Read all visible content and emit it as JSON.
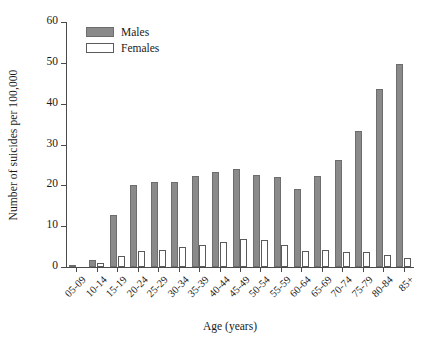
{
  "chart_data": {
    "type": "bar",
    "title": "",
    "xlabel": "Age (years)",
    "ylabel": "Number of suicides per 100,000",
    "categories": [
      "05-09",
      "10-14",
      "15-19",
      "20-24",
      "25-29",
      "30-34",
      "35-39",
      "40-44",
      "45-49",
      "50-54",
      "55-59",
      "60-64",
      "65-69",
      "70-74",
      "75-79",
      "80-84",
      "85+"
    ],
    "series": [
      {
        "name": "Males",
        "color": "#8a8a8a",
        "values": [
          0.1,
          1.8,
          12.7,
          20.1,
          20.7,
          20.9,
          22.2,
          23.2,
          23.9,
          22.6,
          22.0,
          19.2,
          22.2,
          26.3,
          33.3,
          43.6,
          49.7
        ]
      },
      {
        "name": "Females",
        "color": "#ffffff",
        "values": [
          0.0,
          0.9,
          2.6,
          3.9,
          4.2,
          5.0,
          5.4,
          6.2,
          6.9,
          6.6,
          5.4,
          4.0,
          4.2,
          3.6,
          3.7,
          3.0,
          2.3
        ]
      }
    ],
    "ylim": [
      0,
      60
    ],
    "yticks": [
      0,
      10,
      20,
      30,
      40,
      50,
      60
    ],
    "ytick_labels": [
      "0",
      "10",
      "20",
      "30",
      "40",
      "50",
      "60"
    ],
    "grid": false,
    "legend_position": "top-left"
  },
  "legend": {
    "items": [
      {
        "label": "Males",
        "swatch": "filled-gray-swatch"
      },
      {
        "label": "Females",
        "swatch": "empty-white-swatch"
      }
    ]
  }
}
